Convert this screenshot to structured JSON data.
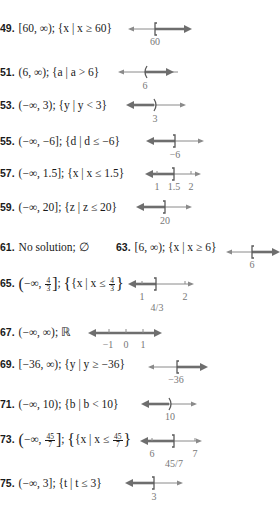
{
  "colors": {
    "text": "#1a1a1a",
    "axis": "#8a8a8a",
    "shade": "#6e6e6e",
    "label": "#777777"
  },
  "answers": [
    {
      "num": "49.",
      "interval": "[60, ∞)",
      "set": "{x | x ≥ 60}",
      "line": {
        "labels": [
          "60"
        ]
      }
    },
    {
      "num": "51.",
      "interval": "(6, ∞)",
      "set": "{a | a > 6}",
      "line": {
        "labels": [
          "6"
        ]
      }
    },
    {
      "num": "53.",
      "interval": "(−∞, 3)",
      "set": "{y | y < 3}",
      "line": {
        "labels": [
          "3"
        ]
      }
    },
    {
      "num": "55.",
      "interval": "(−∞, −6]",
      "set": "{d | d ≤ −6}",
      "line": {
        "labels": [
          "−6"
        ]
      }
    },
    {
      "num": "57.",
      "interval": "(−∞, 1.5]",
      "set": "{x | x ≤ 1.5}",
      "line": {
        "labels": [
          "1",
          "1.5",
          "2"
        ]
      }
    },
    {
      "num": "59.",
      "interval": "(−∞, 20]",
      "set": "{z | z ≤ 20}",
      "line": {
        "labels": [
          "20"
        ]
      }
    },
    {
      "num": "61.",
      "text": "No solution; ∅"
    },
    {
      "num": "63.",
      "interval": "[6, ∞)",
      "set": "{x | x ≥ 6}",
      "line": {
        "labels": [
          "6"
        ]
      }
    },
    {
      "num": "65.",
      "interval_pre": "−∞, ",
      "frac_n": "4",
      "frac_d": "3",
      "set_pre": "{x | x ≤ ",
      "line": {
        "labels": [
          "1",
          "4/3",
          "2"
        ]
      }
    },
    {
      "num": "67.",
      "interval": "(−∞, ∞); ℝ",
      "line": {
        "labels": [
          "−1",
          "0",
          "1"
        ]
      }
    },
    {
      "num": "69.",
      "interval": "[−36, ∞)",
      "set": "{y | y ≥ −36}",
      "line": {
        "labels": [
          "−36"
        ]
      }
    },
    {
      "num": "71.",
      "interval": "(−∞, 10)",
      "set": "{b | b < 10}",
      "line": {
        "labels": [
          "10"
        ]
      }
    },
    {
      "num": "73.",
      "interval_pre": "−∞, ",
      "frac_n": "45",
      "frac_d": "7",
      "set_pre": "{x | x ≤ ",
      "line": {
        "labels": [
          "6",
          "45/7",
          "7"
        ]
      }
    },
    {
      "num": "75.",
      "interval": "(−∞, 3]",
      "set": "{t | t ≤ 3}",
      "line": {
        "labels": [
          "3"
        ]
      }
    }
  ]
}
